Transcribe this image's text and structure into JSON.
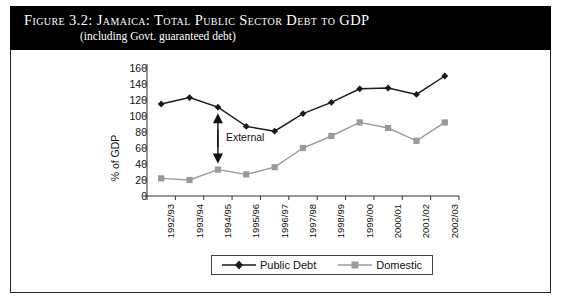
{
  "figure": {
    "title": "Figure 3.2:  Jamaica: Total Public Sector Debt to GDP",
    "subtitle": "(including Govt. guaranteed debt)"
  },
  "chart_data": {
    "type": "line",
    "title": "Figure 3.2:  Jamaica: Total Public Sector Debt to GDP",
    "subtitle": "(including Govt. guaranteed debt)",
    "xlabel": "",
    "ylabel": "% of GDP",
    "ylim": [
      0,
      160
    ],
    "ytick_step": 20,
    "yticks": [
      0,
      20,
      40,
      60,
      80,
      100,
      120,
      140,
      160
    ],
    "grid": false,
    "legend_position": "bottom-center",
    "categories": [
      "1992/93",
      "1993/94",
      "1994/95",
      "1995/96",
      "1996/97",
      "1997/98",
      "1998/99",
      "1999/00",
      "2000/01",
      "2001/02",
      "2002/03"
    ],
    "series": [
      {
        "name": "Public Debt",
        "color": "#1a1a1a",
        "marker": "diamond",
        "values": [
          115,
          123,
          111,
          87,
          81,
          103,
          117,
          134,
          135,
          127,
          150
        ]
      },
      {
        "name": "Domestic",
        "color": "#9a9a9a",
        "marker": "square",
        "values": [
          22,
          20,
          33,
          27,
          36,
          60,
          75,
          92,
          85,
          69,
          92
        ]
      }
    ],
    "annotations": [
      {
        "text": "External",
        "type": "double-headed-arrow",
        "at_category": "1994/95",
        "from_value": 33,
        "to_value": 111
      }
    ]
  },
  "legend": {
    "items": [
      {
        "label": "Public Debt"
      },
      {
        "label": "Domestic"
      }
    ]
  }
}
